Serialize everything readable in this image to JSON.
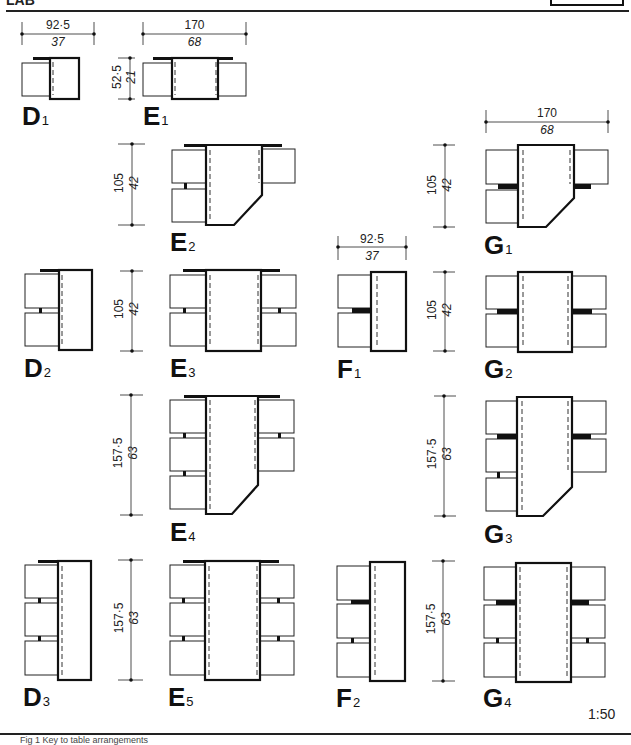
{
  "page": {
    "header_text": "LAB",
    "scale": "1:50",
    "footer_caption": "Fig 1 Key to table arrangements"
  },
  "dimensions": {
    "w_92_5": {
      "metric": "92·5",
      "imperial": "37"
    },
    "w_170": {
      "metric": "170",
      "imperial": "68"
    },
    "h_52_5": {
      "metric": "52·5",
      "imperial": "21"
    },
    "h_105": {
      "metric": "105",
      "imperial": "42"
    },
    "h_157_5": {
      "metric": "157·5",
      "imperial": "63"
    }
  },
  "layouts": [
    {
      "id": "D1",
      "letter": "D",
      "sub": "1"
    },
    {
      "id": "E1",
      "letter": "E",
      "sub": "1"
    },
    {
      "id": "E2",
      "letter": "E",
      "sub": "2"
    },
    {
      "id": "G1",
      "letter": "G",
      "sub": "1"
    },
    {
      "id": "D2",
      "letter": "D",
      "sub": "2"
    },
    {
      "id": "E3",
      "letter": "E",
      "sub": "3"
    },
    {
      "id": "F1",
      "letter": "F",
      "sub": "1"
    },
    {
      "id": "G2",
      "letter": "G",
      "sub": "2"
    },
    {
      "id": "E4",
      "letter": "E",
      "sub": "4"
    },
    {
      "id": "G3",
      "letter": "G",
      "sub": "3"
    },
    {
      "id": "D3",
      "letter": "D",
      "sub": "3"
    },
    {
      "id": "E5",
      "letter": "E",
      "sub": "5"
    },
    {
      "id": "F2",
      "letter": "F",
      "sub": "2"
    },
    {
      "id": "G4",
      "letter": "G",
      "sub": "4"
    }
  ],
  "colors": {
    "line": "#111111",
    "background": "#ffffff"
  }
}
